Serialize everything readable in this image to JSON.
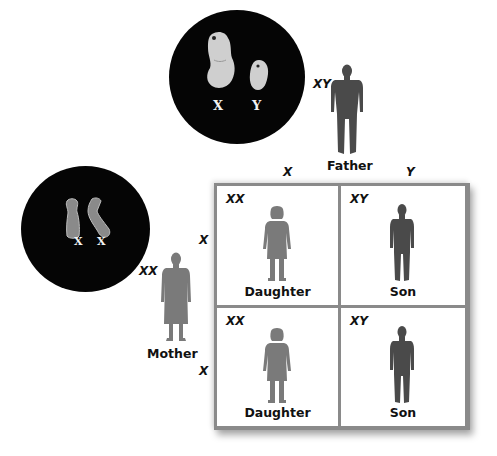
{
  "father": {
    "genotype": "XY",
    "label": "Father",
    "chromosomes": [
      "X",
      "Y"
    ],
    "gametes": [
      "X",
      "Y"
    ]
  },
  "mother": {
    "genotype": "XX",
    "label": "Mother",
    "chromosomes": [
      "X",
      "X"
    ],
    "gametes": [
      "X",
      "X"
    ]
  },
  "punnett": {
    "cells": [
      {
        "genotype": "XX",
        "label": "Daughter"
      },
      {
        "genotype": "XY",
        "label": "Son"
      },
      {
        "genotype": "XX",
        "label": "Daughter"
      },
      {
        "genotype": "XY",
        "label": "Son"
      }
    ]
  },
  "colors": {
    "circle": "#050505",
    "chromosome": "#c8c8c8",
    "daughter_silhouette": "#7a7a7a",
    "son_silhouette": "#4a4a4a",
    "grid_frame": "#8a8a8a"
  }
}
